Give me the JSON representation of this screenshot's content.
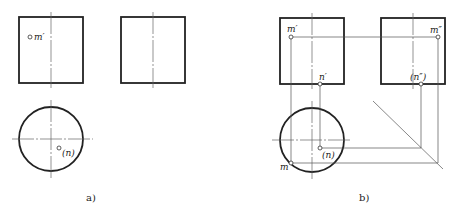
{
  "figure": {
    "panel_a": {
      "caption": "a)",
      "labels": {
        "m_front": "m′",
        "n_top": "(n)"
      }
    },
    "panel_b": {
      "caption": "b)",
      "labels": {
        "m_front": "m′",
        "n_front": "n′",
        "m_side": "m″",
        "n_side": "(n″)",
        "n_top": "(n)",
        "m_top": "m"
      }
    }
  },
  "colors": {
    "line": "#222222",
    "thin_line": "#555555",
    "background": "#ffffff"
  }
}
